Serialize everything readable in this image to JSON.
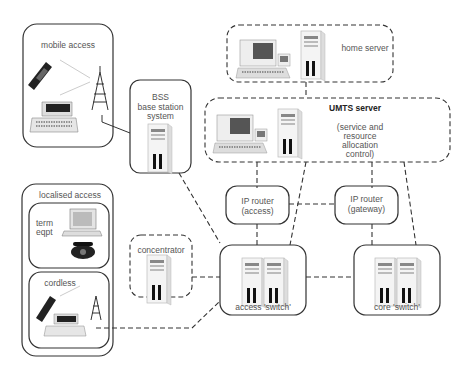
{
  "diagram": {
    "nodes": {
      "mobile_access": {
        "label": "mobile access"
      },
      "bss": {
        "label_line1": "BSS",
        "label_line2": "base station",
        "label_line3": "system"
      },
      "home_server": {
        "label": "home server"
      },
      "umts_server": {
        "title": "UMTS server",
        "line1": "(service and",
        "line2": "resource",
        "line3": "allocation",
        "line4": "control)"
      },
      "localised_access": {
        "label": "localised access"
      },
      "term_eqpt": {
        "line1": "term",
        "line2": "eqpt"
      },
      "cordless": {
        "label": "cordless"
      },
      "concentrator": {
        "label": "concentrator"
      },
      "ip_router_access": {
        "line1": "IP router",
        "line2": "(access)"
      },
      "ip_router_gateway": {
        "line1": "IP router",
        "line2": "(gateway)"
      },
      "access_switch": {
        "label": "access 'switch'"
      },
      "core_switch": {
        "label": "core 'switch'"
      }
    },
    "edges": [
      {
        "from": "mobile_access_antenna",
        "to": "bss",
        "style": "solid"
      },
      {
        "from": "home_server",
        "to": "umts_server",
        "style": "dashed"
      },
      {
        "from": "bss",
        "to": "access_switch",
        "style": "dashed"
      },
      {
        "from": "umts_server",
        "to": "ip_router_access",
        "style": "dashed"
      },
      {
        "from": "umts_server",
        "to": "access_switch",
        "style": "dashed"
      },
      {
        "from": "umts_server",
        "to": "ip_router_gateway",
        "style": "dashed"
      },
      {
        "from": "umts_server",
        "to": "core_switch",
        "style": "dashed"
      },
      {
        "from": "ip_router_access",
        "to": "ip_router_gateway",
        "style": "dashed"
      },
      {
        "from": "ip_router_access",
        "to": "access_switch",
        "style": "dashed"
      },
      {
        "from": "ip_router_gateway",
        "to": "core_switch",
        "style": "dashed"
      },
      {
        "from": "access_switch",
        "to": "core_switch",
        "style": "dashed"
      },
      {
        "from": "concentrator",
        "to": "access_switch",
        "style": "dashed"
      },
      {
        "from": "cordless_antenna",
        "to": "access_switch",
        "style": "dashed"
      }
    ]
  }
}
